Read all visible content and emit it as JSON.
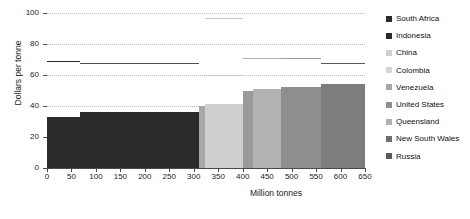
{
  "chart_data": {
    "type": "bar",
    "title": "",
    "subtitle": "",
    "xlabel": "Million tonnes",
    "ylabel": "Dollars per tonne",
    "xlim": [
      0,
      650
    ],
    "ylim": [
      0,
      100
    ],
    "xticks": [
      0,
      50,
      100,
      150,
      200,
      250,
      300,
      350,
      400,
      450,
      500,
      550,
      600,
      650
    ],
    "yticks": [
      0,
      20,
      40,
      60,
      80,
      100
    ],
    "grid": true,
    "legend_position": "right",
    "orientation": "supply-cost-curve",
    "categories": [
      "South Africa",
      "Indonesia",
      "China",
      "Colombia",
      "Venezuela",
      "United States",
      "Queensland",
      "New South Wales",
      "Russia"
    ],
    "series": [
      {
        "name": "Cost",
        "note": "Step widths are cumulative million tonnes; heights are dollars per tonne",
        "steps": [
          {
            "label": "South Africa",
            "x_start": 0,
            "x_end": 68,
            "width": 68,
            "value": 33,
            "color": "#2b2b2b"
          },
          {
            "label": "Indonesia",
            "x_start": 68,
            "x_end": 311,
            "width": 243,
            "value": 36,
            "color": "#2b2b2b"
          },
          {
            "label": "China",
            "x_start": 311,
            "x_end": 323,
            "width": 12,
            "value": 40,
            "color": "#a8a8a8"
          },
          {
            "label": "Colombia",
            "x_start": 323,
            "x_end": 401,
            "width": 78,
            "value": 41,
            "color": "#cfcfcf"
          },
          {
            "label": "Venezuela",
            "x_start": 401,
            "x_end": 421,
            "width": 20,
            "value": 50,
            "color": "#9a9a9a"
          },
          {
            "label": "United States",
            "x_start": 421,
            "x_end": 478,
            "width": 57,
            "value": 51,
            "color": "#b3b3b3"
          },
          {
            "label": "Queensland",
            "x_start": 478,
            "x_end": 560,
            "width": 82,
            "value": 52,
            "color": "#8e8e8e"
          },
          {
            "label": "New South Wales",
            "x_start": 560,
            "x_end": 650,
            "width": 90,
            "value": 54,
            "color": "#7d7d7d"
          },
          {
            "label": "Russia",
            "x_start": 650,
            "x_end": 650,
            "width": 0,
            "value": 54,
            "color": "#6e6e6e"
          }
        ]
      }
    ],
    "reference_lines": [
      {
        "name": "price-line-1",
        "x_start": 0,
        "x_end": 68,
        "value": 69,
        "color": "#2b2b2b"
      },
      {
        "name": "price-line-2",
        "x_start": 68,
        "x_end": 311,
        "value": 68,
        "color": "#4d4d4d"
      },
      {
        "name": "price-line-3",
        "x_start": 323,
        "x_end": 401,
        "value": 97,
        "color": "#c4c4c4"
      },
      {
        "name": "price-line-4",
        "x_start": 323,
        "x_end": 401,
        "value": 60,
        "color": "#c9c9c9"
      },
      {
        "name": "price-line-5",
        "x_start": 401,
        "x_end": 478,
        "value": 71,
        "color": "#b0b0b0"
      },
      {
        "name": "price-line-6",
        "x_start": 478,
        "x_end": 560,
        "value": 71,
        "color": "#9c9c9c"
      },
      {
        "name": "price-line-7",
        "x_start": 560,
        "x_end": 650,
        "value": 68,
        "color": "#5a5a5a"
      }
    ],
    "legend": [
      {
        "label": "South Africa",
        "color": "#2b2b2b"
      },
      {
        "label": "Indonesia",
        "color": "#2b2b2b"
      },
      {
        "label": "China",
        "color": "#cfcfcf"
      },
      {
        "label": "Colombia",
        "color": "#d6d6d6"
      },
      {
        "label": "Venezuela",
        "color": "#a8a8a8"
      },
      {
        "label": "United States",
        "color": "#8e8e8e"
      },
      {
        "label": "Queensland",
        "color": "#b0b0b0"
      },
      {
        "label": "New South Wales",
        "color": "#6e6e6e"
      },
      {
        "label": "Russia",
        "color": "#5a5a5a"
      }
    ]
  },
  "axis": {
    "y_label": "Dollars per tonne",
    "x_label": "Million tonnes"
  }
}
